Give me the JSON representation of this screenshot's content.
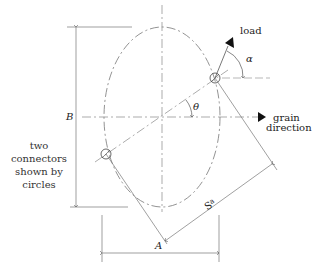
{
  "diagram": {
    "labels": {
      "load": "load",
      "alpha": "α",
      "theta": "θ",
      "grain_line1": "grain",
      "grain_line2": "direction",
      "B": "B",
      "A": "A",
      "S": "S",
      "S_sub": "a"
    },
    "note": [
      "two",
      "connectors",
      "shown by",
      "circles"
    ],
    "colors": {
      "line": "#555555",
      "text": "#222222",
      "arrow_fill": "#111111",
      "background": "#ffffff"
    }
  }
}
